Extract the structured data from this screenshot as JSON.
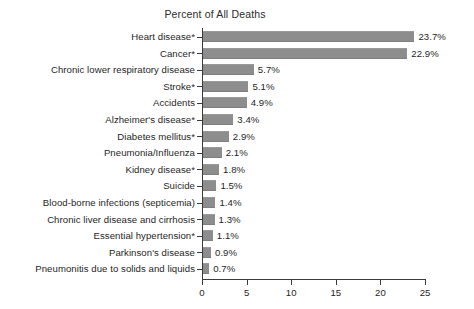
{
  "chart_data": {
    "type": "bar",
    "orientation": "horizontal",
    "title": "Percent of All Deaths",
    "xlabel": "",
    "ylabel": "",
    "xlim": [
      0,
      25
    ],
    "xticks": [
      "0",
      "5",
      "10",
      "15",
      "20",
      "25"
    ],
    "grid": false,
    "legend": null,
    "bar_color": "#8d8d8d",
    "axis_color": "#3a3a3a",
    "background": "#ffffff",
    "categories": [
      "Heart disease*",
      "Cancer*",
      "Chronic lower respiratory disease",
      "Stroke*",
      "Accidents",
      "Alzheimer's disease*",
      "Diabetes mellitus*",
      "Pneumonia/Influenza",
      "Kidney disease*",
      "Suicide",
      "Blood-borne infections (septicemia)",
      "Chronic liver disease and cirrhosis",
      "Essential hypertension*",
      "Parkinson's disease",
      "Pneumonitis due to solids and liquids"
    ],
    "values": [
      23.7,
      22.9,
      5.7,
      5.1,
      4.9,
      3.4,
      2.9,
      2.1,
      1.8,
      1.5,
      1.4,
      1.3,
      1.1,
      0.9,
      0.7
    ],
    "value_labels": [
      "23.7%",
      "22.9%",
      "5.7%",
      "5.1%",
      "4.9%",
      "3.4%",
      "2.9%",
      "2.1%",
      "1.8%",
      "1.5%",
      "1.4%",
      "1.3%",
      "1.1%",
      "0.9%",
      "0.7%"
    ]
  }
}
